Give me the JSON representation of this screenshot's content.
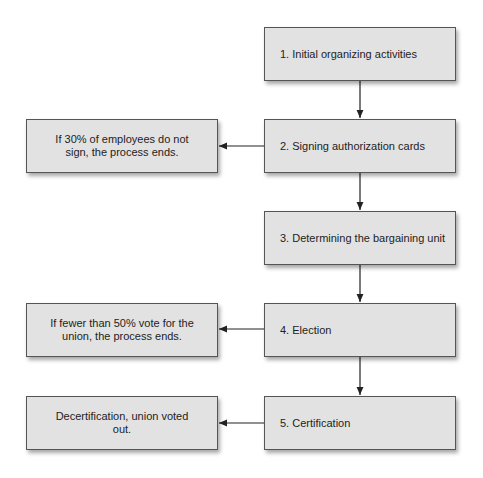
{
  "diagram": {
    "type": "flowchart",
    "steps": [
      {
        "id": "s1",
        "label": "1.  Initial organizing activities"
      },
      {
        "id": "s2",
        "label": "2.  Signing authorization cards"
      },
      {
        "id": "s3",
        "label": "3.  Determining the bargaining unit"
      },
      {
        "id": "s4",
        "label": "4.  Election"
      },
      {
        "id": "s5",
        "label": "5.  Certification"
      }
    ],
    "outcomes": [
      {
        "id": "o1",
        "label": "If 30% of employees do not sign, the process ends.",
        "from": "s2"
      },
      {
        "id": "o2",
        "label": "If fewer than 50% vote for the union, the process ends.",
        "from": "s4"
      },
      {
        "id": "o3",
        "label": "Decertification, union voted out.",
        "from": "s5"
      }
    ],
    "colors": {
      "box_fill": "#e2e2e2",
      "box_border": "#555555",
      "arrow": "#222222"
    }
  }
}
